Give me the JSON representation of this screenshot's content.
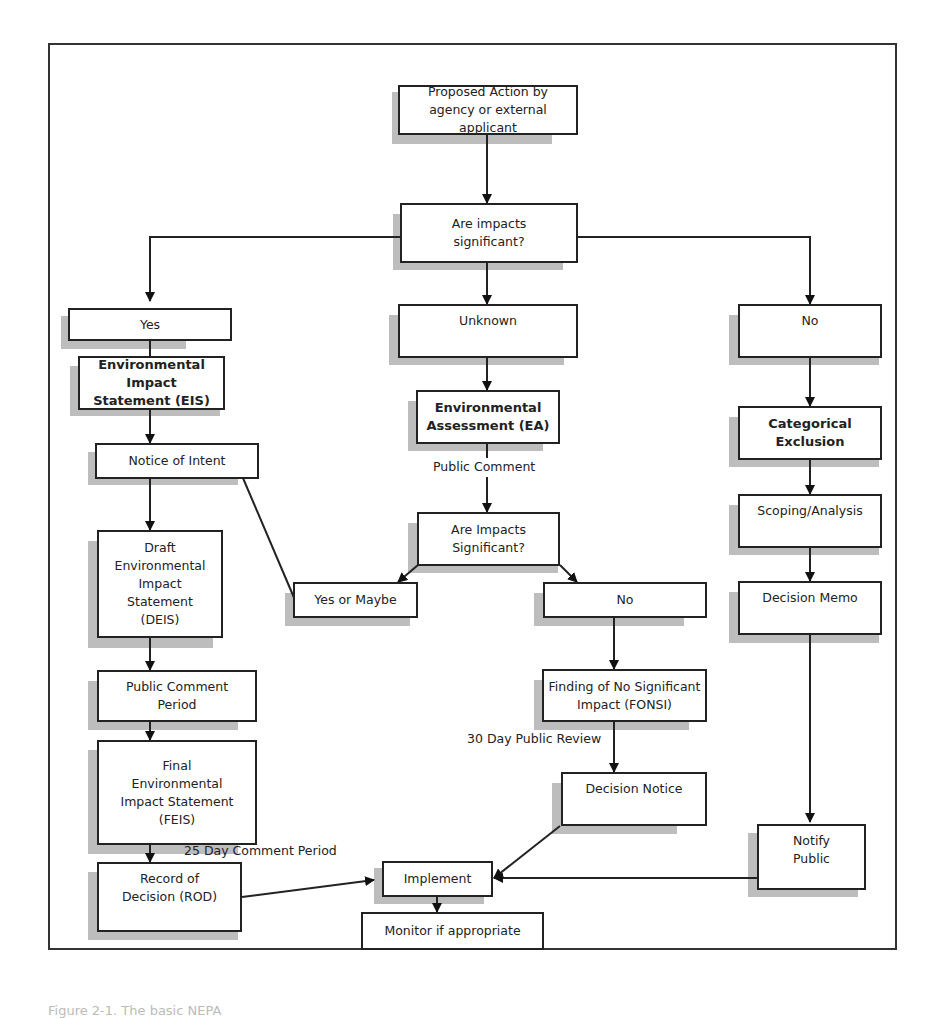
{
  "diagram": {
    "nodes": {
      "proposed_action": "Proposed Action by\nagency or external\napplicant",
      "impacts_q1": "Are impacts\nsignificant?",
      "yes": "Yes",
      "unknown": "Unknown",
      "no_right": "No",
      "eis": "Environmental Impact\nStatement (EIS)",
      "ea": "Environmental\nAssessment (EA)",
      "catex": "Categorical\nExclusion",
      "notice_of_intent": "Notice of Intent",
      "impacts_q2": "Are Impacts\nSignificant?",
      "scoping": "Scoping/Analysis",
      "deis": "Draft\nEnvironmental\nImpact\nStatement\n(DEIS)",
      "yes_or_maybe": "Yes or Maybe",
      "no_mid": "No",
      "decision_memo": "Decision Memo",
      "public_comment_period": "Public Comment\nPeriod",
      "fonsi": "Finding of No Significant\nImpact (FONSI)",
      "feis": "Final\nEnvironmental\nImpact Statement\n(FEIS)",
      "decision_notice": "Decision Notice",
      "rod": "Record of\nDecision (ROD)",
      "implement": "Implement",
      "notify_public": "Notify\nPublic",
      "monitor": "Monitor if appropriate"
    },
    "edge_labels": {
      "public_comment": "Public Comment",
      "thirty_day": "30 Day Public Review",
      "twentyfive_day": "25 Day Comment Period"
    },
    "caption": "Figure 2-1. The basic NEPA"
  }
}
